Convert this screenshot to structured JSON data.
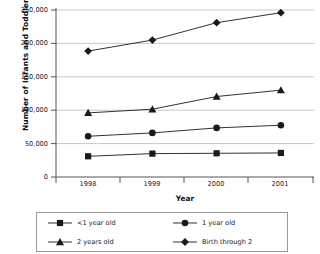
{
  "chart_data": {
    "type": "line",
    "title": "",
    "xlabel": "Year",
    "ylabel": "Number of Infants and Toddlers Served",
    "categories": [
      "1998",
      "1999",
      "2000",
      "2001"
    ],
    "ylim": [
      0,
      250000
    ],
    "yticks": [
      0,
      50000,
      100000,
      150000,
      200000,
      250000
    ],
    "ytick_labels": [
      "0",
      "50,000",
      "100,000",
      "150,000",
      "200,000",
      "250,000"
    ],
    "grid": "horizontal",
    "legend_position": "bottom",
    "series": [
      {
        "name": "<1 year old",
        "marker": "square",
        "values": [
          31000,
          35000,
          35500,
          36000
        ]
      },
      {
        "name": "1 year old",
        "marker": "circle",
        "values": [
          61000,
          66000,
          73500,
          77500
        ]
      },
      {
        "name": "2 years old",
        "marker": "triangle",
        "values": [
          96000,
          101500,
          120500,
          130000
        ]
      },
      {
        "name": "Birth through 2",
        "marker": "diamond",
        "values": [
          188500,
          205000,
          231000,
          246000
        ]
      }
    ]
  },
  "axes": {
    "y_title": "Number of Infants and Toddlers Served",
    "x_title": "Year"
  },
  "ytick_labels": {
    "t0": "0",
    "t1": "50,000",
    "t2": "100,000",
    "t3": "150,000",
    "t4": "200,000",
    "t5": "250,000"
  },
  "xtick_labels": {
    "t0": "1998",
    "t1": "1999",
    "t2": "2000",
    "t3": "2001"
  },
  "legend": {
    "items": [
      {
        "label": "<1 year old",
        "marker": "square"
      },
      {
        "label": "1 year old",
        "marker": "circle"
      },
      {
        "label": "2 years old",
        "marker": "triangle"
      },
      {
        "label": "Birth through 2",
        "marker": "diamond"
      }
    ]
  },
  "colors": {
    "line": "#1a1a1a",
    "grid": "#c9c9c9",
    "axis": "#555555",
    "background": "#ffffff"
  }
}
